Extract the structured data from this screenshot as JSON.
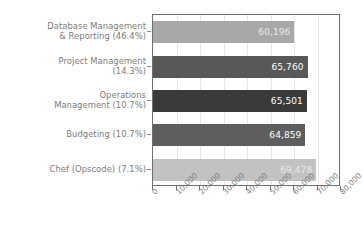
{
  "chart_data": {
    "type": "bar",
    "orientation": "horizontal",
    "title": "",
    "subtitle": "",
    "xlabel": "",
    "ylabel": "",
    "grid": true,
    "legend": false,
    "legend_position": "none",
    "xlim": [
      0,
      80000
    ],
    "categories": [
      "Database Management\n& Reporting (46.4%)",
      "Project Management\n(14.3%)",
      "Operations\nManagement (10.7%)",
      "Budgeting (10.7%)",
      "Chef (Opscode) (7.1%)"
    ],
    "values": [
      60196,
      65760,
      65501,
      64859,
      69478
    ],
    "value_labels": [
      "60,196",
      "65,760",
      "65,501",
      "64,859",
      "69,478"
    ],
    "bar_colors": [
      "#a8a8a8",
      "#585858",
      "#3a3a3a",
      "#5e5e5e",
      "#c2c2c2"
    ],
    "xticks": [
      0,
      10000,
      20000,
      30000,
      40000,
      50000,
      60000,
      70000,
      80000
    ],
    "xtick_labels": [
      "0",
      "10,000",
      "20,000",
      "30,000",
      "40,000",
      "50,000",
      "60,000",
      "70,000",
      "80,000"
    ]
  },
  "style": {
    "axis_color": "#6f6f6f",
    "grid_color": "#e6e6e6",
    "text_color": "#7b7b7b",
    "value_text_color": "#ffffff",
    "background": "#ffffff"
  }
}
